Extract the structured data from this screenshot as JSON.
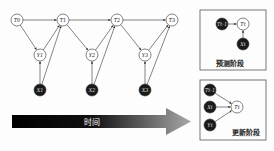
{
  "main_graph": {
    "nodes": [
      {
        "id": "T0",
        "label": "T0",
        "x": 17,
        "y": 20,
        "dark": false
      },
      {
        "id": "T1",
        "label": "T1",
        "x": 63,
        "y": 20,
        "dark": false
      },
      {
        "id": "T2",
        "label": "T2",
        "x": 117,
        "y": 20,
        "dark": false
      },
      {
        "id": "T3",
        "label": "T3",
        "x": 172,
        "y": 20,
        "dark": false
      },
      {
        "id": "Y1",
        "label": "Y1",
        "x": 40,
        "y": 55,
        "dark": false
      },
      {
        "id": "Y2",
        "label": "Y2",
        "x": 92,
        "y": 55,
        "dark": false
      },
      {
        "id": "Y3",
        "label": "Y3",
        "x": 145,
        "y": 55,
        "dark": false
      },
      {
        "id": "X1",
        "label": "X1",
        "x": 40,
        "y": 90,
        "dark": true
      },
      {
        "id": "X2",
        "label": "X2",
        "x": 92,
        "y": 90,
        "dark": true
      },
      {
        "id": "X3",
        "label": "X3",
        "x": 145,
        "y": 90,
        "dark": true
      }
    ],
    "edges": [
      [
        "T0",
        "T1"
      ],
      [
        "T1",
        "T2"
      ],
      [
        "T2",
        "T3"
      ],
      [
        "T0",
        "Y1"
      ],
      [
        "Y1",
        "T1"
      ],
      [
        "X1",
        "Y1"
      ],
      [
        "X1",
        "T1"
      ],
      [
        "T1",
        "Y2"
      ],
      [
        "Y2",
        "T2"
      ],
      [
        "X2",
        "Y2"
      ],
      [
        "X2",
        "T2"
      ],
      [
        "T2",
        "Y3"
      ],
      [
        "Y3",
        "T3"
      ],
      [
        "X3",
        "Y3"
      ],
      [
        "X3",
        "T3"
      ]
    ]
  },
  "time_arrow": {
    "label": "时间"
  },
  "predict_box": {
    "caption": "预测阶段",
    "nodes": [
      {
        "id": "Tprev",
        "label": "Tt-1",
        "x": 222,
        "y": 24,
        "dark": true
      },
      {
        "id": "Tt",
        "label": "Tt",
        "x": 243,
        "y": 24,
        "dark": false
      },
      {
        "id": "Xt",
        "label": "Xt",
        "x": 243,
        "y": 44,
        "dark": true
      }
    ],
    "edges": [
      [
        "Tprev",
        "Tt"
      ],
      [
        "Xt",
        "Tt"
      ]
    ]
  },
  "update_box": {
    "caption": "更新阶段",
    "nodes": [
      {
        "id": "Tprev",
        "label": "Tt-1",
        "x": 210,
        "y": 90,
        "dark": true
      },
      {
        "id": "Xt",
        "label": "Xt",
        "x": 210,
        "y": 107,
        "dark": true
      },
      {
        "id": "Yt",
        "label": "Yt",
        "x": 210,
        "y": 125,
        "dark": true
      },
      {
        "id": "Tt",
        "label": "Tt",
        "x": 237,
        "y": 107,
        "dark": false
      }
    ],
    "edges": [
      [
        "Tprev",
        "Tt"
      ],
      [
        "Xt",
        "Tt"
      ],
      [
        "Yt",
        "Tt"
      ]
    ]
  }
}
